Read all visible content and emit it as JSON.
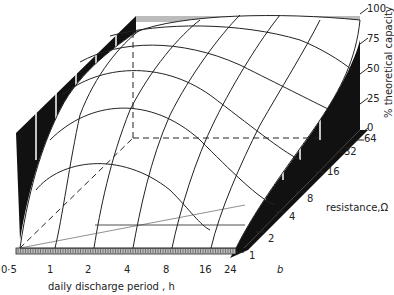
{
  "chart_data": {
    "type": "surface3d",
    "title": "",
    "xlabel": "daily discharge period , h",
    "ylabel": "resistance,Ω",
    "zlabel": "% theoretical capacity",
    "panel_label": "b",
    "x_ticks": [
      "0·5",
      "1",
      "2",
      "4",
      "8",
      "16",
      "24"
    ],
    "y_ticks": [
      "1",
      "2",
      "4",
      "8",
      "16",
      "32",
      "64"
    ],
    "z_ticks": [
      "0",
      "25",
      "50",
      "75",
      "100"
    ],
    "zlim": [
      0,
      100
    ],
    "grid": true,
    "surface_description": "Capacity rises with longer daily discharge period and higher resistance; saturates near 100% at high resistance and long discharge periods",
    "x": [
      0.5,
      1,
      2,
      4,
      8,
      16,
      24
    ],
    "y": [
      1,
      2,
      4,
      8,
      16,
      32,
      64
    ],
    "z_approx": [
      [
        2,
        20,
        30,
        35,
        38,
        40,
        42
      ],
      [
        5,
        30,
        38,
        42,
        44,
        46,
        48
      ],
      [
        15,
        45,
        50,
        52,
        54,
        56,
        58
      ],
      [
        45,
        60,
        62,
        62,
        63,
        65,
        68
      ],
      [
        70,
        80,
        78,
        76,
        77,
        80,
        84
      ],
      [
        88,
        93,
        92,
        90,
        90,
        92,
        94
      ],
      [
        97,
        99,
        100,
        100,
        100,
        100,
        100
      ]
    ]
  }
}
